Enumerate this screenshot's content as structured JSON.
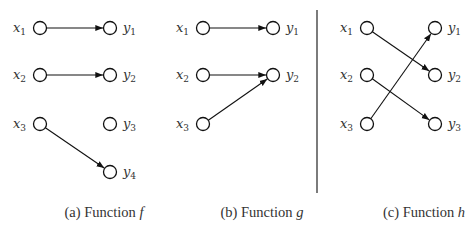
{
  "figure": {
    "panels": [
      {
        "id": "a",
        "caption_prefix": "(a) Function ",
        "function_name": "f",
        "domain": [
          {
            "var": "x",
            "sub": "1"
          },
          {
            "var": "x",
            "sub": "2"
          },
          {
            "var": "x",
            "sub": "3"
          }
        ],
        "codomain": [
          {
            "var": "y",
            "sub": "1"
          },
          {
            "var": "y",
            "sub": "2"
          },
          {
            "var": "y",
            "sub": "3"
          },
          {
            "var": "y",
            "sub": "4"
          }
        ],
        "mapping": [
          [
            0,
            0
          ],
          [
            1,
            1
          ],
          [
            2,
            3
          ]
        ]
      },
      {
        "id": "b",
        "caption_prefix": "(b) Function ",
        "function_name": "g",
        "domain": [
          {
            "var": "x",
            "sub": "1"
          },
          {
            "var": "x",
            "sub": "2"
          },
          {
            "var": "x",
            "sub": "3"
          }
        ],
        "codomain": [
          {
            "var": "y",
            "sub": "1"
          },
          {
            "var": "y",
            "sub": "2"
          }
        ],
        "mapping": [
          [
            0,
            0
          ],
          [
            1,
            1
          ],
          [
            2,
            1
          ]
        ]
      },
      {
        "id": "c",
        "caption_prefix": "(c) Function ",
        "function_name": "h",
        "domain": [
          {
            "var": "x",
            "sub": "1"
          },
          {
            "var": "x",
            "sub": "2"
          },
          {
            "var": "x",
            "sub": "3"
          }
        ],
        "codomain": [
          {
            "var": "y",
            "sub": "1"
          },
          {
            "var": "y",
            "sub": "2"
          },
          {
            "var": "y",
            "sub": "3"
          }
        ],
        "mapping": [
          [
            0,
            1
          ],
          [
            1,
            2
          ],
          [
            2,
            0
          ]
        ]
      }
    ]
  }
}
